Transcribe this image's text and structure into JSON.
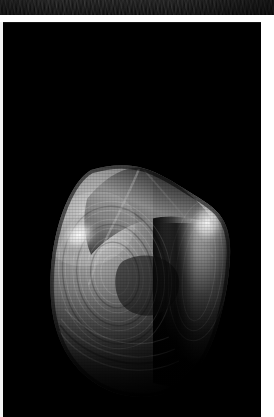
{
  "window": {
    "background_color": "#ffffff",
    "width": 274,
    "height": 417
  },
  "top_strip": {
    "label": "cropped-image-strip",
    "description": "Partially cropped dark textured image band at top of page",
    "background_color": "#0a0a0a",
    "height": 15
  },
  "viewport": {
    "label": "3D render viewport",
    "background_color": "#000000",
    "border_color": "#141414",
    "width": 258,
    "height": 395
  },
  "render": {
    "title": "volumetric-surface-render",
    "object_name": "grayscale isosurface",
    "shading": "grayscale diffuse with specular highlights",
    "silhouette_color": "#9a9a9a",
    "highlight_color": "#ffffff",
    "shadow_color": "#000000",
    "midtone_color": "#5a5a5a",
    "bounds": {
      "left": 47,
      "top": 142,
      "right": 228,
      "bottom": 372
    },
    "highlights": [
      {
        "name": "upper-left-specular",
        "cx": 76,
        "cy": 212,
        "rx": 26,
        "ry": 20,
        "intensity": "bright"
      },
      {
        "name": "upper-right-specular",
        "cx": 206,
        "cy": 202,
        "rx": 22,
        "ry": 26,
        "intensity": "bright"
      }
    ],
    "features": [
      "diagonal crest ridge across the top facet",
      "concentric contour banding on the left lobe",
      "vertical shadow crease down the right-of-center",
      "lower body fading to black"
    ]
  }
}
